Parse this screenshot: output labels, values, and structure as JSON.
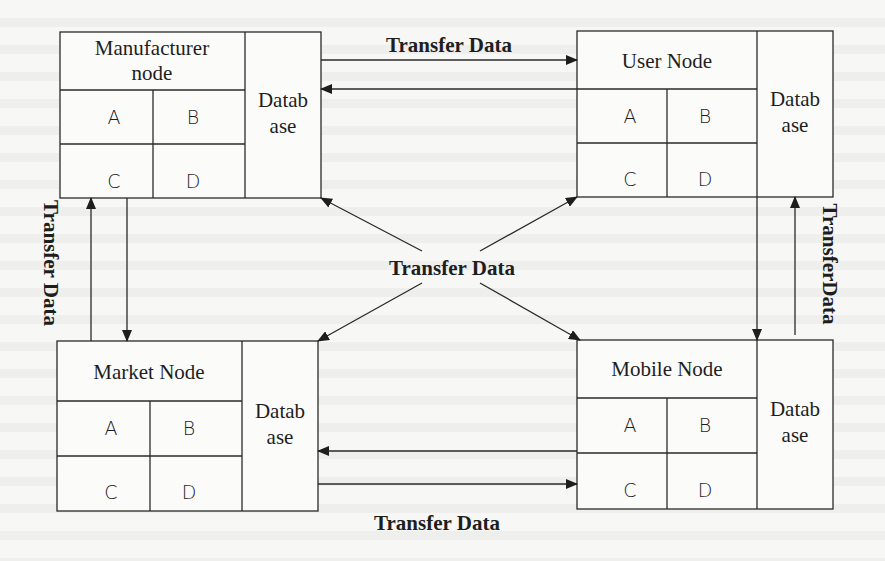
{
  "diagram": {
    "type": "data transfer architecture",
    "nodes": [
      {
        "id": "manufacturer",
        "title_lines": [
          "Manufacturer",
          "node"
        ],
        "cells": [
          "A",
          "B",
          "C",
          "D"
        ],
        "database_lines": [
          "Datab",
          "ase"
        ]
      },
      {
        "id": "user",
        "title_lines": [
          "User Node"
        ],
        "cells": [
          "A",
          "B",
          "C",
          "D"
        ],
        "database_lines": [
          "Datab",
          "ase"
        ]
      },
      {
        "id": "market",
        "title_lines": [
          "Market Node"
        ],
        "cells": [
          "A",
          "B",
          "C",
          "D"
        ],
        "database_lines": [
          "Datab",
          "ase"
        ]
      },
      {
        "id": "mobile",
        "title_lines": [
          "Mobile Node"
        ],
        "cells": [
          "A",
          "B",
          "C",
          "D"
        ],
        "database_lines": [
          "Datab",
          "ase"
        ]
      }
    ],
    "edges": [
      {
        "id": "top",
        "between": [
          "manufacturer",
          "user"
        ],
        "direction": "bidirectional",
        "label": "Transfer Data"
      },
      {
        "id": "bottom",
        "between": [
          "market",
          "mobile"
        ],
        "direction": "bidirectional",
        "label": "Transfer Data"
      },
      {
        "id": "left",
        "between": [
          "manufacturer",
          "market"
        ],
        "direction": "bidirectional",
        "label": "Transfer Data"
      },
      {
        "id": "right",
        "between": [
          "user",
          "mobile"
        ],
        "direction": "bidirectional",
        "label": "TransferData"
      },
      {
        "id": "center",
        "from": "center-hub",
        "to": [
          "manufacturer",
          "user",
          "market",
          "mobile"
        ],
        "direction": "outward",
        "label": "Transfer Data"
      }
    ]
  },
  "colors": {
    "ink": "#1e1e1e",
    "paper": "#f7f7f5"
  }
}
